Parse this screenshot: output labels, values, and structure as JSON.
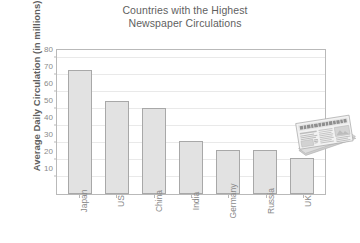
{
  "chart_data": {
    "type": "bar",
    "title": "Countries with the Highest\nNewspaper Circulations",
    "xlabel": "",
    "ylabel": "Average Daily Circulation (in millions)",
    "categories": [
      "Japan",
      "US",
      "China",
      "India",
      "Germany",
      "Russia",
      "UK"
    ],
    "values": [
      73,
      55,
      51,
      31,
      26,
      26,
      21
    ],
    "ylim": [
      0,
      85
    ],
    "yticks": [
      10,
      20,
      30,
      40,
      50,
      60,
      70,
      80
    ],
    "ytick_labels": [
      "10",
      "20",
      "30",
      "40",
      "50",
      "60",
      "70",
      "80"
    ],
    "grid": true,
    "legend": "none",
    "series": [
      {
        "name": "Average Daily Circulation",
        "values": [
          73,
          55,
          51,
          31,
          26,
          26,
          21
        ]
      }
    ],
    "annotations": [
      {
        "name": "newspaper-illustration",
        "description": "Folded newspaper graphic placed inside the upper right of the plot area"
      }
    ]
  },
  "style": {
    "bar_fill": "#e2e2e2",
    "bar_border": "#a8a8a8",
    "grid_color": "#e9e9e9",
    "axis_color": "#b9b9b9",
    "text_color": "#8a8a8a",
    "title_color": "#5f5f5f",
    "background": "#ffffff"
  }
}
